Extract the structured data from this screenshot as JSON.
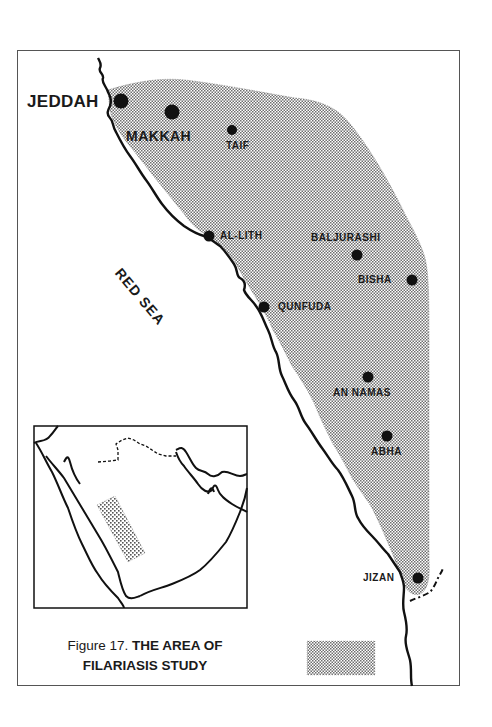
{
  "figure": {
    "caption_prefix": "Figure 17.",
    "caption_title_line1": "THE AREA OF",
    "caption_title_line2": "FILARIASIS STUDY"
  },
  "map": {
    "sea_label": "RED SEA",
    "cities": [
      {
        "name": "JEDDAH",
        "x": 120,
        "y": 100,
        "size": "major"
      },
      {
        "name": "MAKKAH",
        "x": 172,
        "y": 112,
        "size": "major"
      },
      {
        "name": "TAIF",
        "x": 232,
        "y": 130,
        "size": "small"
      },
      {
        "name": "AL-LITH",
        "x": 209,
        "y": 236,
        "size": "small"
      },
      {
        "name": "BALJURASHI",
        "x": 357,
        "y": 255,
        "size": "small"
      },
      {
        "name": "BISHA",
        "x": 412,
        "y": 280,
        "size": "small"
      },
      {
        "name": "QUNFUDA",
        "x": 264,
        "y": 307,
        "size": "small"
      },
      {
        "name": "AN NAMAS",
        "x": 368,
        "y": 377,
        "size": "small"
      },
      {
        "name": "ABHA",
        "x": 387,
        "y": 436,
        "size": "small"
      },
      {
        "name": "JIZAN",
        "x": 418,
        "y": 578,
        "size": "small"
      }
    ],
    "legend": {
      "swatch": "stippled-area",
      "meaning": "study area"
    },
    "inset": {
      "description": "Arabian Peninsula locator map with study area shaded"
    }
  },
  "colors": {
    "ink": "#111111",
    "stipple": "#7a7a7a",
    "background": "#ffffff",
    "frame": "#555555"
  }
}
